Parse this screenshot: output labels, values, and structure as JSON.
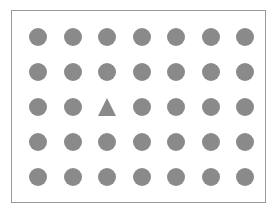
{
  "stimulus": {
    "name": "visual-search-array",
    "description": "Odd-one-out visual search array: a grid of gray circles containing a single gray triangle target",
    "canvas": {
      "width": 277,
      "height": 216,
      "background_color": "#ffffff"
    },
    "frame": {
      "x": 11,
      "y": 10,
      "width": 255,
      "height": 193,
      "border_width": 1,
      "border_color": "#999999",
      "fill_color": "#ffffff"
    },
    "grid": {
      "columns": 7,
      "rows": 5,
      "first_center_x": 37,
      "first_center_y": 36,
      "col_spacing": 34.5,
      "row_spacing": 35,
      "shape_color": "#8a8a8a",
      "circle_diameter": 18,
      "triangle_width": 19,
      "triangle_height": 18
    },
    "target": {
      "shape": "triangle",
      "row_index": 2,
      "column_index": 2,
      "label": "triangle-target"
    },
    "distractor": {
      "shape": "circle",
      "label": "circle-distractor",
      "count": 34
    },
    "items": [
      {
        "row": 0,
        "col": 0,
        "shape": "circle"
      },
      {
        "row": 0,
        "col": 1,
        "shape": "circle"
      },
      {
        "row": 0,
        "col": 2,
        "shape": "circle"
      },
      {
        "row": 0,
        "col": 3,
        "shape": "circle"
      },
      {
        "row": 0,
        "col": 4,
        "shape": "circle"
      },
      {
        "row": 0,
        "col": 5,
        "shape": "circle"
      },
      {
        "row": 0,
        "col": 6,
        "shape": "circle"
      },
      {
        "row": 1,
        "col": 0,
        "shape": "circle"
      },
      {
        "row": 1,
        "col": 1,
        "shape": "circle"
      },
      {
        "row": 1,
        "col": 2,
        "shape": "circle"
      },
      {
        "row": 1,
        "col": 3,
        "shape": "circle"
      },
      {
        "row": 1,
        "col": 4,
        "shape": "circle"
      },
      {
        "row": 1,
        "col": 5,
        "shape": "circle"
      },
      {
        "row": 1,
        "col": 6,
        "shape": "circle"
      },
      {
        "row": 2,
        "col": 0,
        "shape": "circle"
      },
      {
        "row": 2,
        "col": 1,
        "shape": "circle"
      },
      {
        "row": 2,
        "col": 2,
        "shape": "triangle"
      },
      {
        "row": 2,
        "col": 3,
        "shape": "circle"
      },
      {
        "row": 2,
        "col": 4,
        "shape": "circle"
      },
      {
        "row": 2,
        "col": 5,
        "shape": "circle"
      },
      {
        "row": 2,
        "col": 6,
        "shape": "circle"
      },
      {
        "row": 3,
        "col": 0,
        "shape": "circle"
      },
      {
        "row": 3,
        "col": 1,
        "shape": "circle"
      },
      {
        "row": 3,
        "col": 2,
        "shape": "circle"
      },
      {
        "row": 3,
        "col": 3,
        "shape": "circle"
      },
      {
        "row": 3,
        "col": 4,
        "shape": "circle"
      },
      {
        "row": 3,
        "col": 5,
        "shape": "circle"
      },
      {
        "row": 3,
        "col": 6,
        "shape": "circle"
      },
      {
        "row": 4,
        "col": 0,
        "shape": "circle"
      },
      {
        "row": 4,
        "col": 1,
        "shape": "circle"
      },
      {
        "row": 4,
        "col": 2,
        "shape": "circle"
      },
      {
        "row": 4,
        "col": 3,
        "shape": "circle"
      },
      {
        "row": 4,
        "col": 4,
        "shape": "circle"
      },
      {
        "row": 4,
        "col": 5,
        "shape": "circle"
      },
      {
        "row": 4,
        "col": 6,
        "shape": "circle"
      }
    ]
  }
}
